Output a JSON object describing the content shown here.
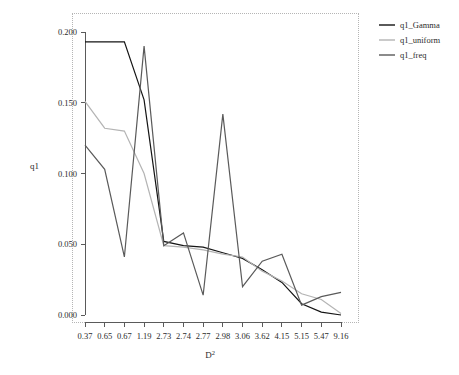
{
  "chart_data": {
    "type": "line",
    "title": "",
    "xlabel": "D²",
    "ylabel": "q1",
    "categories": [
      "0.37",
      "0.65",
      "0.67",
      "1.19",
      "2.73",
      "2.74",
      "2.77",
      "2.98",
      "3.06",
      "3.62",
      "4.15",
      "5.15",
      "5.47",
      "9.16"
    ],
    "x_tick_labels": [
      "0.37",
      "0.65",
      "0.67",
      "1.19",
      "2.73",
      "2.74",
      "2.77",
      "2.98",
      "3.06",
      "3.62",
      "4.15",
      "5.15",
      "5.47",
      "9.16"
    ],
    "y_tick_labels": [
      "0.000",
      "0.050",
      "0.100",
      "0.150",
      "0.200"
    ],
    "y_tick_values": [
      0.0,
      0.05,
      0.1,
      0.15,
      0.2
    ],
    "ylim": [
      0.0,
      0.21
    ],
    "grid": false,
    "legend_position": "right-top",
    "series": [
      {
        "name": "q1_Gamma",
        "color": "#141414",
        "values": [
          0.193,
          0.193,
          0.193,
          0.152,
          0.052,
          0.049,
          0.048,
          0.044,
          0.04,
          0.032,
          0.023,
          0.008,
          0.002,
          0.0
        ]
      },
      {
        "name": "q1_uniform",
        "color": "#b4b4b4",
        "values": [
          0.151,
          0.132,
          0.13,
          0.1,
          0.049,
          0.048,
          0.046,
          0.043,
          0.041,
          0.031,
          0.024,
          0.015,
          0.011,
          0.001
        ]
      },
      {
        "name": "q1_freq",
        "color": "#5a5a5a",
        "values": [
          0.12,
          0.103,
          0.041,
          0.19,
          0.049,
          0.058,
          0.014,
          0.142,
          0.02,
          0.038,
          0.043,
          0.007,
          0.013,
          0.016
        ]
      }
    ]
  },
  "legend": {
    "items": [
      {
        "label": "q1_Gamma",
        "color": "#141414"
      },
      {
        "label": "q1_uniform",
        "color": "#b4b4b4"
      },
      {
        "label": "q1_freq",
        "color": "#5a5a5a"
      }
    ]
  },
  "axes": {
    "y_axis_title": "q1",
    "x_axis_title_base": "D",
    "x_axis_title_sup": "2"
  },
  "colors": {
    "frame": "#b5b5b5",
    "axis": "#5a5a5a",
    "text": "#2b2b2b",
    "background": "#ffffff"
  }
}
